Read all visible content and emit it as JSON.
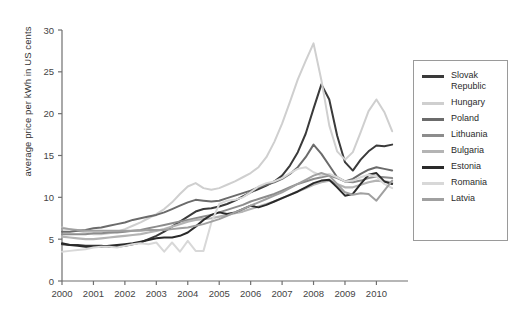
{
  "chart_data": {
    "type": "line",
    "title": "",
    "xlabel": "",
    "ylabel": "average price per kWh in US cents",
    "xlim": [
      2000,
      2010.75
    ],
    "ylim": [
      0,
      30
    ],
    "yticks": [
      0,
      5,
      10,
      15,
      20,
      25,
      30
    ],
    "xticks": [
      2000,
      2001,
      2002,
      2003,
      2004,
      2005,
      2006,
      2007,
      2008,
      2009,
      2010
    ],
    "grid": false,
    "legend_position": "right-outside",
    "x": [
      2000,
      2000.25,
      2000.5,
      2000.75,
      2001,
      2001.25,
      2001.5,
      2001.75,
      2002,
      2002.25,
      2002.5,
      2002.75,
      2003,
      2003.25,
      2003.5,
      2003.75,
      2004,
      2004.25,
      2004.5,
      2004.75,
      2005,
      2005.25,
      2005.5,
      2005.75,
      2006,
      2006.25,
      2006.5,
      2006.75,
      2007,
      2007.25,
      2007.5,
      2007.75,
      2008,
      2008.25,
      2008.5,
      2008.75,
      2009,
      2009.25,
      2009.5,
      2009.75,
      2010,
      2010.25,
      2010.5
    ],
    "series": [
      {
        "name": "Slovak Republic",
        "color": "#3a3a3a",
        "width": 2.0,
        "values": [
          4.4,
          4.3,
          4.3,
          4.2,
          4.2,
          4.2,
          4.1,
          4.1,
          4.2,
          4.4,
          4.6,
          5.0,
          5.4,
          5.9,
          6.5,
          7.1,
          7.7,
          8.3,
          8.6,
          8.7,
          8.9,
          9.2,
          9.6,
          10.1,
          10.6,
          11.0,
          11.4,
          11.9,
          12.6,
          13.8,
          15.4,
          17.6,
          20.6,
          23.5,
          21.7,
          17.4,
          14.2,
          13.2,
          14.5,
          15.5,
          16.2,
          16.1,
          16.3
        ]
      },
      {
        "name": "Hungary",
        "color": "#cfcfcf",
        "width": 2.0,
        "values": [
          6.4,
          6.2,
          6.0,
          5.8,
          5.6,
          5.6,
          5.7,
          5.9,
          6.2,
          6.6,
          7.0,
          7.5,
          8.0,
          8.6,
          9.4,
          10.4,
          11.3,
          11.7,
          11.1,
          10.9,
          11.1,
          11.5,
          11.9,
          12.4,
          12.9,
          13.6,
          14.8,
          16.6,
          18.8,
          21.4,
          24.1,
          26.3,
          28.4,
          24.0,
          18.6,
          15.5,
          14.5,
          15.4,
          17.8,
          20.3,
          21.7,
          20.2,
          17.9
        ]
      },
      {
        "name": "Poland",
        "color": "#6b6b6b",
        "width": 2.0,
        "values": [
          5.9,
          5.9,
          6.0,
          6.1,
          6.3,
          6.4,
          6.6,
          6.8,
          7.0,
          7.3,
          7.5,
          7.7,
          7.9,
          8.2,
          8.6,
          9.0,
          9.4,
          9.7,
          9.6,
          9.5,
          9.6,
          9.9,
          10.2,
          10.5,
          10.8,
          11.2,
          11.5,
          11.8,
          12.2,
          12.8,
          13.6,
          14.8,
          16.3,
          15.2,
          13.8,
          12.4,
          11.9,
          12.2,
          12.8,
          13.3,
          13.6,
          13.4,
          13.2
        ]
      },
      {
        "name": "Lithuania",
        "color": "#8c8c8c",
        "width": 2.0,
        "values": [
          5.6,
          5.6,
          5.6,
          5.6,
          5.7,
          5.7,
          5.8,
          5.8,
          5.9,
          6.0,
          6.1,
          6.3,
          6.5,
          6.7,
          6.9,
          7.1,
          7.3,
          7.5,
          7.7,
          7.9,
          8.2,
          8.5,
          8.8,
          9.1,
          9.5,
          9.8,
          10.1,
          10.4,
          10.8,
          11.2,
          11.6,
          11.9,
          12.2,
          12.4,
          12.6,
          12.3,
          11.9,
          11.8,
          12.0,
          12.3,
          12.5,
          12.4,
          12.3
        ]
      },
      {
        "name": "Bulgaria",
        "color": "#b4b4b4",
        "width": 2.2,
        "values": [
          5.3,
          5.2,
          5.1,
          5.0,
          5.0,
          5.1,
          5.2,
          5.3,
          5.4,
          5.5,
          5.6,
          5.8,
          6.0,
          6.2,
          6.5,
          6.8,
          7.1,
          7.3,
          7.4,
          7.5,
          7.7,
          7.9,
          8.1,
          8.3,
          8.6,
          8.9,
          9.2,
          9.5,
          9.9,
          10.3,
          10.7,
          11.1,
          11.5,
          11.8,
          12.0,
          11.6,
          11.2,
          11.2,
          11.5,
          11.8,
          12.0,
          11.9,
          11.8
        ]
      },
      {
        "name": "Estonia",
        "color": "#2a2a2a",
        "width": 2.0,
        "values": [
          4.5,
          4.3,
          4.2,
          4.1,
          4.1,
          4.1,
          4.2,
          4.3,
          4.4,
          4.5,
          4.7,
          4.9,
          5.1,
          5.2,
          5.2,
          5.4,
          5.8,
          6.5,
          7.3,
          7.9,
          8.2,
          8.0,
          8.2,
          8.6,
          9.0,
          8.8,
          9.1,
          9.5,
          9.9,
          10.3,
          10.7,
          11.2,
          11.7,
          12.0,
          12.1,
          11.2,
          10.2,
          10.4,
          11.6,
          12.7,
          12.9,
          11.9,
          11.6
        ]
      },
      {
        "name": "Romania",
        "color": "#d8d8d8",
        "width": 2.0,
        "values": [
          3.5,
          3.6,
          3.7,
          3.8,
          4.0,
          4.1,
          4.1,
          4.0,
          4.2,
          4.4,
          4.5,
          4.4,
          4.6,
          3.5,
          4.6,
          3.5,
          4.8,
          3.6,
          3.6,
          7.0,
          9.2,
          9.6,
          9.7,
          10.0,
          10.6,
          11.3,
          11.7,
          11.9,
          12.3,
          12.9,
          13.4,
          13.6,
          13.0,
          12.6,
          12.8,
          12.4,
          11.9,
          12.0,
          12.4,
          12.7,
          12.5,
          11.6,
          11.1
        ]
      },
      {
        "name": "Latvia",
        "color": "#a0a0a0",
        "width": 2.0,
        "values": [
          6.3,
          6.2,
          6.1,
          6.0,
          6.0,
          6.0,
          6.0,
          6.0,
          6.0,
          6.0,
          6.0,
          6.1,
          6.1,
          6.1,
          6.2,
          6.3,
          6.4,
          6.6,
          6.8,
          7.1,
          7.4,
          7.8,
          8.2,
          8.6,
          9.0,
          9.4,
          9.8,
          10.2,
          10.6,
          11.1,
          11.6,
          12.1,
          12.6,
          12.9,
          12.6,
          11.6,
          10.6,
          10.3,
          10.5,
          10.4,
          9.6,
          10.8,
          12.0
        ]
      }
    ]
  },
  "axes": {
    "ylabel": "average price per kWh in US cents",
    "ytick_labels": [
      "0",
      "5",
      "10",
      "15",
      "20",
      "25",
      "30"
    ],
    "xtick_labels": [
      "2000",
      "2001",
      "2002",
      "2003",
      "2004",
      "2005",
      "2006",
      "2007",
      "2008",
      "2009",
      "2010"
    ]
  },
  "legend": {
    "items": [
      {
        "label": "Slovak Republic",
        "color": "#3a3a3a"
      },
      {
        "label": "Hungary",
        "color": "#cfcfcf"
      },
      {
        "label": "Poland",
        "color": "#6b6b6b"
      },
      {
        "label": "Lithuania",
        "color": "#8c8c8c"
      },
      {
        "label": "Bulgaria",
        "color": "#b4b4b4"
      },
      {
        "label": "Estonia",
        "color": "#2a2a2a"
      },
      {
        "label": "Romania",
        "color": "#d8d8d8"
      },
      {
        "label": "Latvia",
        "color": "#a0a0a0"
      }
    ]
  },
  "colors": {
    "axis": "#6f6f6f",
    "text": "#333333",
    "background": "#ffffff",
    "legend_border": "#9a9a9a"
  }
}
